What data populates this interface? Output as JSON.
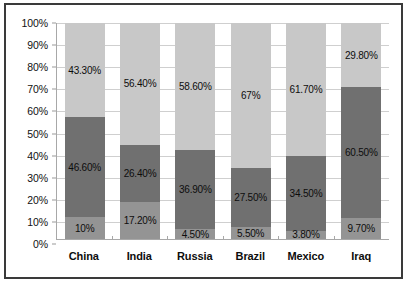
{
  "chart_data": {
    "type": "bar",
    "stacked": true,
    "stack_mode": "percent",
    "title": "",
    "subtitle": "",
    "xlabel": "",
    "ylabel": "",
    "ylim": [
      0,
      100
    ],
    "grid": true,
    "legend": "none",
    "categories": [
      "China",
      "India",
      "Russia",
      "Brazil",
      "Mexico",
      "Iraq"
    ],
    "ytick_labels": [
      "0%",
      "10%",
      "20%",
      "30%",
      "40%",
      "50%",
      "60%",
      "70%",
      "80%",
      "90%",
      "100%"
    ],
    "ytick_values": [
      0,
      10,
      20,
      30,
      40,
      50,
      60,
      70,
      80,
      90,
      100
    ],
    "series": [
      {
        "name": "bottom-segment",
        "color": "#949494",
        "values": [
          10,
          17.2,
          4.5,
          5.5,
          3.8,
          9.7
        ],
        "labels": [
          "10%",
          "17.20%",
          "4.50%",
          "5.50%",
          "3.80%",
          "9.70%"
        ]
      },
      {
        "name": "middle-segment",
        "color": "#707070",
        "values": [
          46.6,
          26.4,
          36.9,
          27.5,
          34.5,
          60.5
        ],
        "labels": [
          "46.60%",
          "26.40%",
          "36.90%",
          "27.50%",
          "34.50%",
          "60.50%"
        ]
      },
      {
        "name": "top-segment",
        "color": "#c8c8c8",
        "values": [
          43.3,
          56.4,
          58.6,
          67,
          61.7,
          29.8
        ],
        "labels": [
          "43.30%",
          "56.40%",
          "58.60%",
          "67%",
          "61.70%",
          "29.80%"
        ]
      }
    ]
  },
  "colors": {
    "frame_border": "#3a3a3a",
    "gridline": "#cfcfcf",
    "axis_line": "#a8a8a8",
    "plot_background": "#ffffff",
    "label_text": "#0d0d0d"
  }
}
